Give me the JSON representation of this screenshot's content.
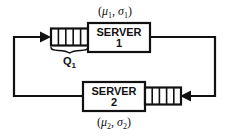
{
  "diagram": {
    "type": "queueing-network",
    "background_color": "#ffffff",
    "line_color": "#111111",
    "servers": [
      {
        "id": "server-1",
        "label_line1": "SERVER",
        "label_line2": "1",
        "parameters_label": "(μ₁, σ₁)",
        "parameter_mu": "μ",
        "parameter_sigma": "σ",
        "parameter_index": "1",
        "parameter_position": "above"
      },
      {
        "id": "server-2",
        "label_line1": "SERVER",
        "label_line2": "2",
        "parameters_label": "(μ₂, σ₂)",
        "parameter_mu": "μ",
        "parameter_sigma": "σ",
        "parameter_index": "2",
        "parameter_position": "below"
      }
    ],
    "queues": [
      {
        "id": "queue-1",
        "label": "Q₁",
        "label_base": "Q",
        "label_index": "1",
        "cells": 5,
        "feeds_server": "server-1",
        "has_brace": true,
        "position": "top-left"
      },
      {
        "id": "queue-2",
        "label": "",
        "cells": 5,
        "feeds_server": "server-2",
        "has_brace": false,
        "position": "bottom-right"
      }
    ],
    "routes": [
      {
        "id": "route-server1-to-queue2",
        "from": "server-1",
        "to": "queue-2",
        "arrow_direction": "left",
        "path": "right-down-left"
      },
      {
        "id": "route-server2-to-queue1",
        "from": "server-2",
        "to": "queue-1",
        "arrow_direction": "right",
        "path": "left-up-right"
      }
    ],
    "punctuation": {
      "paren_open": "(",
      "paren_close": ")",
      "comma": ","
    }
  }
}
